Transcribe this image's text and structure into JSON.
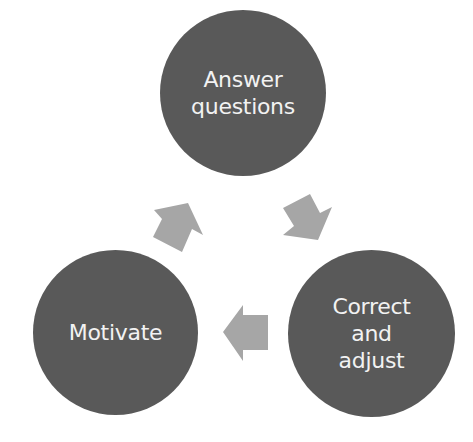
{
  "diagram": {
    "type": "cycle",
    "colors": {
      "node": "#595959",
      "node_text": "#f2f2f2",
      "arrow": "#a6a6a6",
      "background": "#ffffff"
    },
    "nodes": [
      {
        "id": "answer",
        "label": "Answer\nquestions"
      },
      {
        "id": "correct",
        "label": "Correct\nand\nadjust"
      },
      {
        "id": "motivate",
        "label": "Motivate"
      }
    ],
    "edges": [
      {
        "from": "answer",
        "to": "correct"
      },
      {
        "from": "correct",
        "to": "motivate"
      },
      {
        "from": "motivate",
        "to": "answer"
      }
    ]
  }
}
